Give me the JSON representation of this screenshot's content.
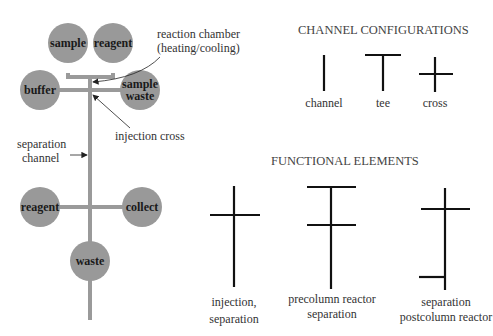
{
  "chip": {
    "reservoirs": [
      {
        "id": "sample",
        "label": "sample"
      },
      {
        "id": "reagent_top",
        "label": "reagent"
      },
      {
        "id": "buffer",
        "label": "buffer"
      },
      {
        "id": "sample_waste",
        "label_line1": "sample",
        "label_line2": "waste"
      },
      {
        "id": "reagent_bottom",
        "label": "reagent"
      },
      {
        "id": "collect",
        "label": "collect"
      },
      {
        "id": "waste",
        "label": "waste"
      }
    ],
    "annotations": {
      "reaction_chamber_line1": "reaction chamber",
      "reaction_chamber_line2": "(heating/cooling)",
      "injection_cross": "injection cross",
      "separation_channel_line1": "separation",
      "separation_channel_line2": "channel"
    },
    "colors": {
      "reservoir": "#999999",
      "channel": "#9a9a9a",
      "line": "#111111"
    }
  },
  "channel_configurations": {
    "title": "CHANNEL CONFIGURATIONS",
    "items": [
      {
        "label": "channel"
      },
      {
        "label": "tee"
      },
      {
        "label": "cross"
      }
    ]
  },
  "functional_elements": {
    "title": "FUNCTIONAL ELEMENTS",
    "items": [
      {
        "label_line1": "injection,",
        "label_line2": "separation"
      },
      {
        "label_line1": "precolumn reactor",
        "label_line2": "separation"
      },
      {
        "label_line1": "separation",
        "label_line2": "postcolumn reactor"
      }
    ]
  }
}
